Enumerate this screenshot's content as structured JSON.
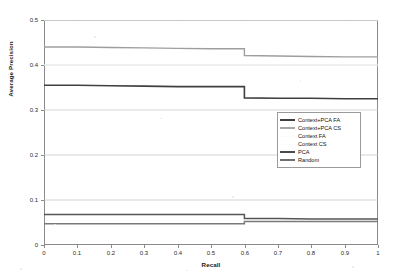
{
  "chart_data": {
    "type": "line",
    "title": "",
    "xlabel": "Recall",
    "ylabel": "Average Precision",
    "xlim": [
      0,
      1
    ],
    "ylim": [
      0,
      0.5
    ],
    "xticks": [
      "0",
      "0.1",
      "0.2",
      "0.3",
      "0.4",
      "0.5",
      "0.6",
      "0.7",
      "0.8",
      "0.9",
      "1"
    ],
    "yticks": [
      "0",
      "0.1",
      "0.2",
      "0.3",
      "0.4",
      "0.5"
    ],
    "grid": "horizontal",
    "legend_position": "center-right",
    "x": [
      0,
      0.1,
      0.2,
      0.3,
      0.4,
      0.5,
      0.6,
      0.7,
      0.8,
      0.9,
      1.0
    ],
    "series": [
      {
        "name": "Context+PCA FA",
        "color": "#404040",
        "width": 1.6,
        "values": [
          0.355,
          0.355,
          0.354,
          0.353,
          0.352,
          0.352,
          0.327,
          0.326,
          0.326,
          0.325,
          0.325
        ]
      },
      {
        "name": "Context+PCA CS",
        "color": "#9e9e9e",
        "width": 1.4,
        "values": [
          0.44,
          0.44,
          0.439,
          0.438,
          0.437,
          0.436,
          0.421,
          0.42,
          0.419,
          0.418,
          0.393
        ]
      },
      {
        "name": "Context FA",
        "color": "#f2f2f2",
        "width": 1.0,
        "values": [
          0.5,
          0.5,
          0.5,
          0.5,
          0.5,
          0.5,
          0.5,
          0.5,
          0.5,
          0.5,
          0.5
        ]
      },
      {
        "name": "Context CS",
        "color": "#f5f5f5",
        "width": 1.0,
        "values": [
          0.4,
          0.4,
          0.4,
          0.4,
          0.4,
          0.4,
          0.4,
          0.4,
          0.4,
          0.4,
          0.4
        ]
      },
      {
        "name": "PCA",
        "color": "#555555",
        "width": 1.5,
        "values": [
          0.068,
          0.068,
          0.068,
          0.068,
          0.068,
          0.068,
          0.059,
          0.059,
          0.058,
          0.058,
          0.058
        ]
      },
      {
        "name": "Random",
        "color": "#7a7a7a",
        "width": 1.5,
        "values": [
          0.047,
          0.047,
          0.047,
          0.047,
          0.047,
          0.047,
          0.052,
          0.052,
          0.052,
          0.052,
          0.052
        ]
      }
    ],
    "gridlines": [
      0.1,
      0.2,
      0.3,
      0.4,
      0.5
    ]
  },
  "axis": {
    "y_title": "Average Precision",
    "x_title": "Recall"
  },
  "legend": {
    "items": [
      {
        "label": "Context+PCA FA",
        "color": "#404040",
        "thickness": 2
      },
      {
        "label": "Context+PCA CS",
        "color": "#a8a8a8",
        "thickness": 2
      },
      {
        "label": "Context FA",
        "color": "#fbfbfb",
        "thickness": 1
      },
      {
        "label": "Context CS",
        "color": "#fbfbfb",
        "thickness": 1
      },
      {
        "label": "PCA",
        "color": "#4a4a4a",
        "thickness": 2
      },
      {
        "label": "Random",
        "color": "#6f6f6f",
        "thickness": 2
      }
    ]
  }
}
